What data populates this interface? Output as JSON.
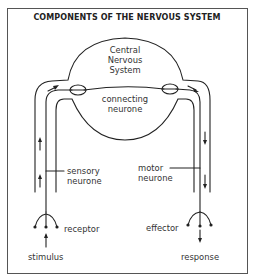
{
  "title": "COMPONENTS OF THE NERVOUS SYSTEM",
  "labels": {
    "cns_line1": "Central",
    "cns_line2": "Nervous",
    "cns_line3": "System",
    "connecting_line1": "connecting",
    "connecting_line2": "neurone",
    "sensory_line1": "sensory",
    "sensory_line2": "neurone",
    "motor_line1": "motor",
    "motor_line2": "neurone",
    "receptor": "receptor",
    "effector": "effector",
    "stimulus": "stimulus",
    "response": "response"
  },
  "colors": {
    "line": "#222222",
    "text": "#333333",
    "frame": "#555555"
  }
}
